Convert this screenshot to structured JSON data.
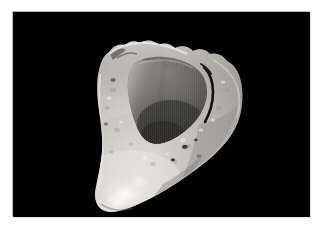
{
  "page": {
    "background_color": "#ffffff",
    "width": 324,
    "height": 228
  },
  "photo": {
    "name": "specimen-photograph",
    "background_color": "#000000",
    "frame_left": 13,
    "frame_top": 12,
    "frame_width": 297,
    "frame_height": 205,
    "alt_text": "Pale bone or tooth specimen with hollow concave cavity photographed against a black background",
    "subject": "bone-tooth-specimen",
    "orientation": "angled-three-quarter-view"
  },
  "specimen": {
    "name": "bone-specimen",
    "description": "Wedge-shaped pale ivory fragment with a deep cup-like concavity at the top and a tapering blade-like tip at lower left",
    "highlight_color": "#f2f0ec",
    "midtone_color": "#c9c6bf",
    "shadow_color": "#8b8882",
    "cavity_color": "#5d5a55",
    "cavity_deep_color": "#3a3835",
    "crack_color": "#141414",
    "surface_features": [
      "rim-notch-upper-left",
      "dark-fissure-right-rim",
      "foramen-pit-center-right",
      "foramen-pit-lower-right",
      "bright-highlight-lower-tip"
    ]
  },
  "icons": {
    "none": ""
  }
}
